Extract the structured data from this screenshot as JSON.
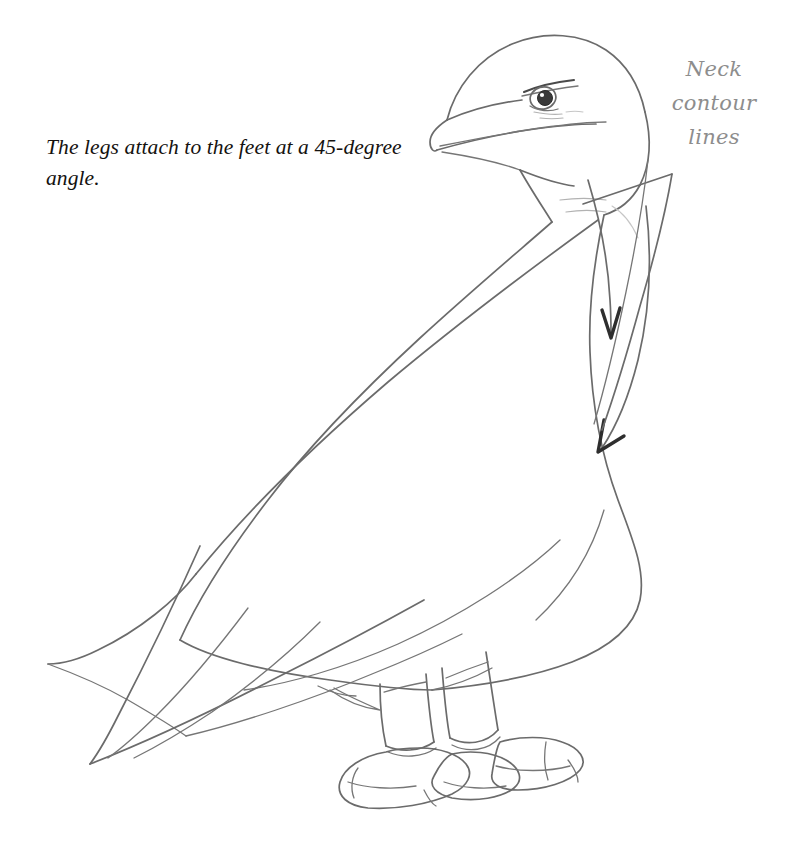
{
  "page": {
    "width": 790,
    "height": 850,
    "background_color": "#ffffff"
  },
  "caption": {
    "text": "The legs attach to the feet at a 45-degree angle.",
    "color": "#14120f"
  },
  "annotation": {
    "label_lines": [
      "Neck",
      "contour",
      "lines"
    ],
    "color": "#8d8d8d"
  },
  "drawing": {
    "title": "Pencil sketch of a standing bird (eagle-like) in profile facing left",
    "pencil_color": "#6b6b6b",
    "pencil_color_dark": "#4a4a4a",
    "pencil_color_faint": "#aaaaaa",
    "parts": [
      "head",
      "beak",
      "eye",
      "brow",
      "neck",
      "body",
      "wing",
      "tail",
      "left-leg",
      "right-leg",
      "left-foot",
      "right-foot"
    ],
    "markers": [
      {
        "name": "neck-contour-arrow-upper",
        "direction": "down"
      },
      {
        "name": "neck-contour-arrow-lower",
        "direction": "down"
      },
      {
        "name": "leader-line-wedge",
        "points_to": "neck"
      }
    ]
  }
}
